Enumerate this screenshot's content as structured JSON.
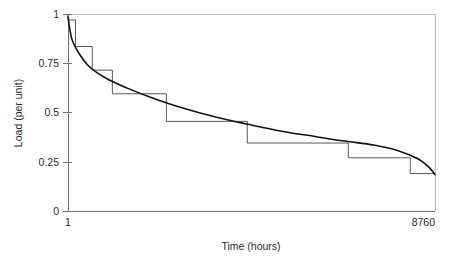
{
  "chart_data": {
    "type": "line",
    "title": "",
    "subtitle": "",
    "xlabel": "Time (hours)",
    "ylabel": "Load (per unit)",
    "xlim": [
      1,
      8760
    ],
    "ylim": [
      0,
      1
    ],
    "grid": false,
    "legend": null,
    "x_tick_labels": [
      "1",
      "8760"
    ],
    "x_tick_values": [
      1,
      8760
    ],
    "y_tick_labels": [
      "0",
      "0.25",
      "0.5",
      "0.75",
      "1"
    ],
    "y_tick_values": [
      0,
      0.25,
      0.5,
      0.75,
      1
    ],
    "series": [
      {
        "name": "Load duration curve",
        "style": "smooth-curve",
        "color": "#111111",
        "x": [
          1,
          90,
          250,
          500,
          900,
          1400,
          2000,
          2700,
          3500,
          4300,
          5100,
          5900,
          6600,
          7300,
          7900,
          8350,
          8600,
          8760
        ],
        "values": [
          0.985,
          0.875,
          0.805,
          0.735,
          0.675,
          0.625,
          0.575,
          0.525,
          0.478,
          0.44,
          0.405,
          0.378,
          0.355,
          0.335,
          0.305,
          0.265,
          0.225,
          0.185
        ]
      },
      {
        "name": "Stepped approximation",
        "style": "staircase",
        "color": "#5a5a5a",
        "step_edges_x": [
          1,
          180,
          580,
          1060,
          2350,
          4280,
          6690,
          8170,
          8760
        ],
        "step_values": [
          0.97,
          0.835,
          0.715,
          0.595,
          0.455,
          0.345,
          0.27,
          0.19
        ]
      }
    ],
    "annotations": []
  },
  "axes": {
    "x_title": "Time (hours)",
    "y_title": "Load (per unit)",
    "x_labels": {
      "left": "1",
      "right": "8760"
    },
    "y_labels": {
      "t1": "1",
      "t2": "0.75",
      "t3": "0.5",
      "t4": "0.25",
      "t5": "0"
    }
  },
  "colors": {
    "curve": "#111111",
    "steps": "#5a5a5a",
    "axis": "#6f6f6f",
    "frame": "#b9b9b9",
    "background": "#ffffff",
    "text": "#2b2b2b"
  }
}
